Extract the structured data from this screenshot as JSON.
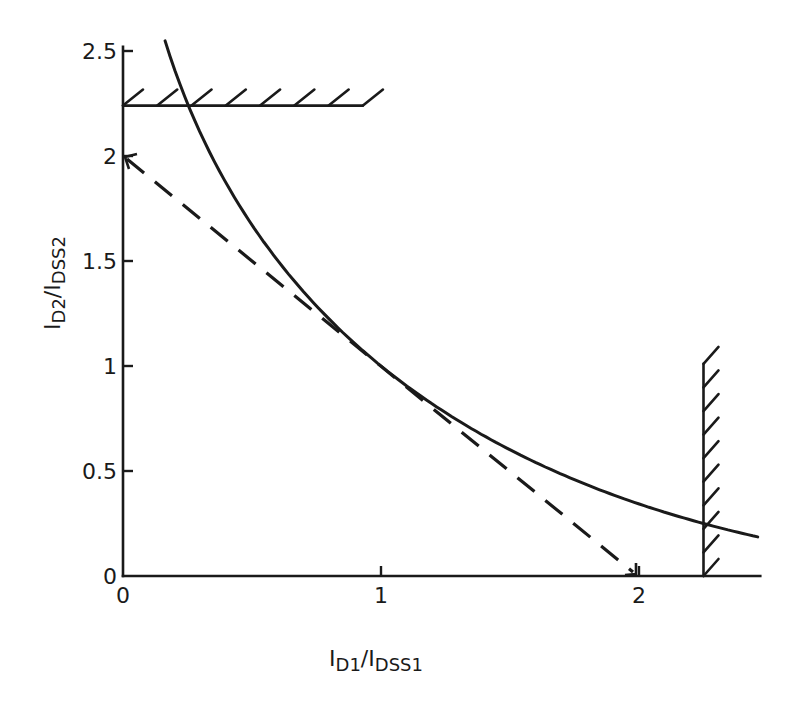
{
  "chart_data": {
    "type": "line",
    "title": "",
    "xlabel": "I_D1/I_DSS1",
    "ylabel": "I_D2/I_DSS2",
    "xlabel_parts": {
      "main": "I",
      "sub1": "D1",
      "slash": "/",
      "main2": "I",
      "sub2": "DSS1"
    },
    "ylabel_parts": {
      "main": "I",
      "sub1": "D2",
      "slash": "/",
      "main2": "I",
      "sub2": "DSS2"
    },
    "xlim": [
      0,
      2.47
    ],
    "ylim": [
      0,
      2.5
    ],
    "grid": false,
    "legend": "none",
    "x_ticks": [
      {
        "value": 0,
        "label": "0"
      },
      {
        "value": 1,
        "label": "1"
      },
      {
        "value": 2,
        "label": "2"
      }
    ],
    "y_ticks": [
      {
        "value": 0,
        "label": "0"
      },
      {
        "value": 0.5,
        "label": "0.5"
      },
      {
        "value": 1,
        "label": "1"
      },
      {
        "value": 1.5,
        "label": "1.5"
      },
      {
        "value": 2,
        "label": "2"
      },
      {
        "value": 2.5,
        "label": "2.5"
      }
    ],
    "series": [
      {
        "name": "solid-curve",
        "style": "solid",
        "description": "y = (2 - sqrt(x))^2",
        "x": [
          0.163,
          0.27,
          0.415,
          0.57,
          0.775,
          1.0,
          1.27,
          1.58,
          1.89,
          2.25,
          2.46
        ],
        "y": [
          2.55,
          2.19,
          1.84,
          1.55,
          1.25,
          1.0,
          0.76,
          0.55,
          0.39,
          0.25,
          0.186
        ]
      },
      {
        "name": "dashed-tangent",
        "style": "dashed",
        "description": "y = 2 - x, tangent at (1,1)",
        "x": [
          0,
          2
        ],
        "y": [
          2,
          0
        ]
      }
    ],
    "boundaries": [
      {
        "name": "horizontal-limit",
        "orientation": "horizontal",
        "y": 2.24,
        "x_from": 0,
        "x_to": 0.93,
        "hatched": true
      },
      {
        "name": "vertical-limit",
        "orientation": "vertical",
        "x": 2.25,
        "y_from": 0,
        "y_to": 1.01,
        "hatched": true
      }
    ]
  },
  "layout": {
    "origin_px": [
      123,
      576
    ],
    "x_px_per_unit": 258,
    "y_px_per_unit": 210,
    "x_axis_end": 2.47,
    "y_axis_top": 2.52
  }
}
